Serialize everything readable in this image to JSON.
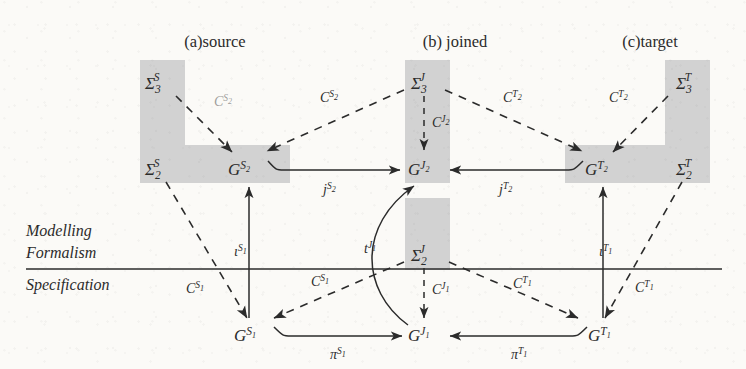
{
  "figure": {
    "type": "commutative-diagram",
    "caption_groups": [
      {
        "id": "a",
        "label": "(a)source"
      },
      {
        "id": "b",
        "label": "(b) joined"
      },
      {
        "id": "c",
        "label": "(c)target"
      }
    ],
    "layer_labels": {
      "upper_line1": "Modelling",
      "upper_line2": "Formalism",
      "lower": "Specification"
    },
    "nodes": [
      {
        "id": "sigma3S",
        "base": "Σ",
        "sub": "3",
        "sup": "S",
        "x": 155,
        "y": 82
      },
      {
        "id": "sigma2S",
        "base": "Σ",
        "sub": "2",
        "sup": "S",
        "x": 155,
        "y": 168
      },
      {
        "id": "GS2",
        "base": "G",
        "sub": "",
        "sup": "S₂",
        "x": 243,
        "y": 168
      },
      {
        "id": "sigma3J",
        "base": "Σ",
        "sub": "3",
        "sup": "J",
        "x": 423,
        "y": 82
      },
      {
        "id": "GJ2",
        "base": "G",
        "sub": "",
        "sup": "J₂",
        "x": 423,
        "y": 168
      },
      {
        "id": "sigma2J",
        "base": "Σ",
        "sub": "2",
        "sup": "J",
        "x": 423,
        "y": 254
      },
      {
        "id": "GJ1",
        "base": "G",
        "sub": "",
        "sup": "J₁",
        "x": 423,
        "y": 334
      },
      {
        "id": "sigma3T",
        "base": "Σ",
        "sub": "3",
        "sup": "T",
        "x": 688,
        "y": 82
      },
      {
        "id": "sigma2T",
        "base": "Σ",
        "sub": "2",
        "sup": "T",
        "x": 688,
        "y": 168
      },
      {
        "id": "GT2",
        "base": "G",
        "sub": "",
        "sup": "T₂",
        "x": 600,
        "y": 168
      },
      {
        "id": "GS1",
        "base": "G",
        "sub": "",
        "sup": "S₁",
        "x": 249,
        "y": 334
      },
      {
        "id": "GT1",
        "base": "G",
        "sub": "",
        "sup": "T₁",
        "x": 603,
        "y": 334
      }
    ],
    "edge_labels": [
      {
        "id": "cS2-left",
        "text": "C",
        "sup": "S₂",
        "x": 222,
        "y": 101,
        "faded": true
      },
      {
        "id": "cS2-right",
        "text": "C",
        "sup": "S₂",
        "x": 329,
        "y": 97,
        "faded": false
      },
      {
        "id": "cJ2",
        "text": "C",
        "sup": "J₂",
        "x": 440,
        "y": 122,
        "faded": false
      },
      {
        "id": "cT2-left",
        "text": "C",
        "sup": "T₂",
        "x": 512,
        "y": 97,
        "faded": false
      },
      {
        "id": "cT2-right",
        "text": "C",
        "sup": "T₂",
        "x": 618,
        "y": 97,
        "faded": false
      },
      {
        "id": "jS2",
        "text": "j",
        "sup": "S₂",
        "x": 329,
        "y": 188,
        "faded": false
      },
      {
        "id": "jT2",
        "text": "j",
        "sup": "T₂",
        "x": 505,
        "y": 188,
        "faded": false
      },
      {
        "id": "iotaS1",
        "text": "ι",
        "sup": "S₁",
        "x": 243,
        "y": 251,
        "faded": false
      },
      {
        "id": "tJ1",
        "text": "t",
        "sup": "J₁",
        "x": 372,
        "y": 248,
        "faded": false
      },
      {
        "id": "iotaT1",
        "text": "ι",
        "sup": "T₁",
        "x": 607,
        "y": 251,
        "faded": false
      },
      {
        "id": "cS1-left",
        "text": "C",
        "sup": "S₁",
        "x": 195,
        "y": 288,
        "faded": false
      },
      {
        "id": "cS1-mid",
        "text": "C",
        "sup": "S₁",
        "x": 320,
        "y": 281,
        "faded": false
      },
      {
        "id": "cJ1",
        "text": "C",
        "sup": "J₁",
        "x": 440,
        "y": 289,
        "faded": false
      },
      {
        "id": "cT1-mid",
        "text": "C",
        "sup": "T₁",
        "x": 522,
        "y": 283,
        "faded": false
      },
      {
        "id": "cT1-right",
        "text": "C",
        "sup": "T₁",
        "x": 644,
        "y": 287,
        "faded": false
      },
      {
        "id": "piS1",
        "text": "π",
        "sup": "S₁",
        "x": 337,
        "y": 353,
        "faded": false
      },
      {
        "id": "piT1",
        "text": "π",
        "sup": "T₁",
        "x": 518,
        "y": 353,
        "faded": false
      }
    ],
    "colors": {
      "shade": "#d2d2d2",
      "ink": "#2b2b2b",
      "paper": "#fbfaf7"
    }
  }
}
